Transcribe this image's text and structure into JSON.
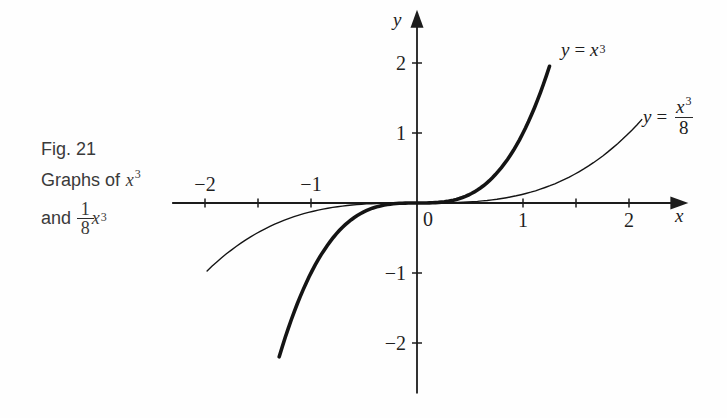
{
  "caption": {
    "line1": "Fig. 21",
    "line2_text": "Graphs of",
    "line2_var": "x",
    "line2_exp": "3",
    "line3_text": "and",
    "line3_frac_num": "1",
    "line3_frac_den": "8",
    "line3_var": "x",
    "line3_exp": "3"
  },
  "curve_labels": {
    "cubed": {
      "lhs": "y",
      "eq": "=",
      "var": "x",
      "exp": "3"
    },
    "eighth": {
      "lhs": "y",
      "eq": "=",
      "num_var": "x",
      "num_exp": "3",
      "den": "8"
    }
  },
  "chart_data": {
    "type": "line",
    "xlabel": "x",
    "ylabel": "y",
    "origin_label": "0",
    "grid": false,
    "legend_position": "labels-at-curve-ends",
    "x_axis": {
      "range": [
        -2.31,
        2.56
      ],
      "ticks": [
        {
          "value": -2,
          "label": "−2",
          "label_position": "above"
        },
        {
          "value": -1.5,
          "label": "",
          "label_position": "above"
        },
        {
          "value": -1,
          "label": "−1",
          "label_position": "above"
        },
        {
          "value": 1,
          "label": "1",
          "label_position": "below"
        },
        {
          "value": 1.5,
          "label": "",
          "label_position": "below"
        },
        {
          "value": 2,
          "label": "2",
          "label_position": "below"
        }
      ]
    },
    "y_axis": {
      "range": [
        -2.72,
        2.76
      ],
      "ticks": [
        {
          "value": 2,
          "label": "2"
        },
        {
          "value": 1,
          "label": "1"
        },
        {
          "value": -1,
          "label": "−1"
        },
        {
          "value": -2,
          "label": "−2"
        }
      ]
    },
    "series": [
      {
        "name": "y-equals-x-cubed",
        "equation": "y = x^3",
        "coefficient": 1,
        "x_range": [
          -1.3,
          1.25
        ],
        "stroke_width": 3.6,
        "key_points": [
          [
            -1.3,
            -2.2
          ],
          [
            -1,
            -1
          ],
          [
            -0.5,
            -0.125
          ],
          [
            0,
            0
          ],
          [
            0.5,
            0.125
          ],
          [
            1,
            1
          ],
          [
            1.25,
            1.95
          ]
        ]
      },
      {
        "name": "y-equals-x-cubed-over-8",
        "equation": "y = x^3/8",
        "coefficient": 0.125,
        "x_range": [
          -1.98,
          2.12
        ],
        "stroke_width": 1.4,
        "key_points": [
          [
            -1.98,
            -0.97
          ],
          [
            -1,
            -0.125
          ],
          [
            0,
            0
          ],
          [
            1,
            0.125
          ],
          [
            2,
            1
          ],
          [
            2.12,
            1.19
          ]
        ]
      }
    ]
  }
}
